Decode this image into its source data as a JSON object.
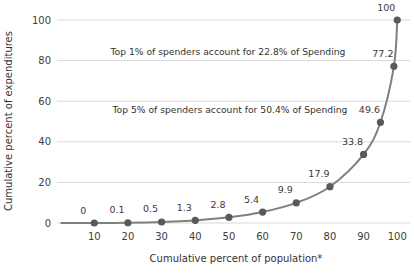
{
  "chart_data": {
    "type": "line",
    "title": "",
    "xlabel": "Cumulative percent of population*",
    "ylabel": "Cumulative percent of expenditures",
    "xlim": [
      0,
      104
    ],
    "ylim": [
      0,
      100
    ],
    "x_ticks": [
      10,
      20,
      30,
      40,
      50,
      60,
      70,
      80,
      90,
      100
    ],
    "y_ticks": [
      0,
      20,
      40,
      60,
      80,
      100
    ],
    "grid": "horizontal-only",
    "legend": "none",
    "series": [
      {
        "name": "cumulative-expenditures",
        "points": [
          {
            "x": 0,
            "y": 0,
            "label": "",
            "marker": false
          },
          {
            "x": 10,
            "y": 0,
            "label": "0",
            "marker": true
          },
          {
            "x": 20,
            "y": 0.1,
            "label": "0.1",
            "marker": true
          },
          {
            "x": 30,
            "y": 0.5,
            "label": "0.5",
            "marker": true
          },
          {
            "x": 40,
            "y": 1.3,
            "label": "1.3",
            "marker": true
          },
          {
            "x": 50,
            "y": 2.8,
            "label": "2.8",
            "marker": true
          },
          {
            "x": 60,
            "y": 5.4,
            "label": "5.4",
            "marker": true
          },
          {
            "x": 70,
            "y": 9.9,
            "label": "9.9",
            "marker": true
          },
          {
            "x": 80,
            "y": 17.9,
            "label": "17.9",
            "marker": true
          },
          {
            "x": 90,
            "y": 33.8,
            "label": "33.8",
            "marker": true
          },
          {
            "x": 95,
            "y": 49.6,
            "label": "49.6",
            "marker": true
          },
          {
            "x": 99,
            "y": 77.2,
            "label": "77.2",
            "marker": true
          },
          {
            "x": 100,
            "y": 100,
            "label": "100",
            "marker": true
          }
        ]
      }
    ],
    "annotations": [
      {
        "text": "Top 1% of spenders account for 22.8% of Spending",
        "x": 49.7,
        "y": 84.2
      },
      {
        "text": "Top 5% of spenders account for 50.4% of Spending",
        "x": 50.3,
        "y": 55.6
      }
    ]
  },
  "colors": {
    "line": "#7f7f7f",
    "marker": "#595959",
    "gridline": "#d9d9d9",
    "text": "#404040",
    "background": "#ffffff"
  }
}
